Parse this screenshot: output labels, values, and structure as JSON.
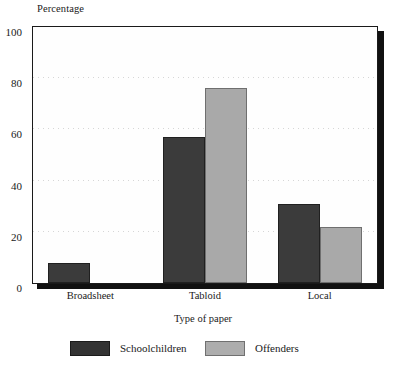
{
  "chart_data": {
    "type": "bar",
    "title": "",
    "xlabel": "Type of paper",
    "ylabel": "Percentage",
    "categories": [
      "Broadsheet",
      "Tabloid",
      "Local"
    ],
    "series": [
      {
        "name": "Schoolchildren",
        "color": "#3b3b3b",
        "values": [
          8,
          57,
          31
        ]
      },
      {
        "name": "Offenders",
        "color": "#a9a9a9",
        "values": [
          0,
          76,
          22
        ]
      }
    ],
    "ylim": [
      0,
      100
    ],
    "yticks": [
      0,
      20,
      40,
      60,
      80,
      100
    ],
    "ytick_labels": [
      "0",
      "20",
      "40",
      "60",
      "80",
      "100"
    ],
    "grid": true,
    "grid_axis": "y",
    "legend_position": "bottom"
  },
  "axes": {
    "y_title": "Percentage",
    "x_title": "Type of paper"
  },
  "legend": {
    "items": [
      {
        "label": "Schoolchildren",
        "swatch": "dark"
      },
      {
        "label": "Offenders",
        "swatch": "light"
      }
    ]
  }
}
